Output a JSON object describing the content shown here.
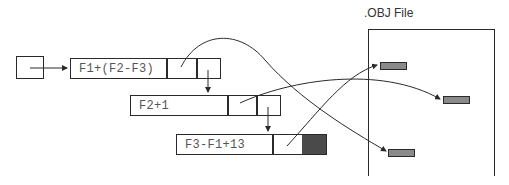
{
  "diagram": {
    "obj_file": {
      "title": ".OBJ File"
    },
    "records": [
      {
        "expression": "F1+(F2-F3)"
      },
      {
        "expression": "F2+1"
      },
      {
        "expression": "F3-F1+13"
      }
    ],
    "colors": {
      "stroke": "#2a2a2a",
      "terminal_cell": "#4a4a4a",
      "obj_entry": "#8a8a8a",
      "text": "#555555"
    }
  }
}
